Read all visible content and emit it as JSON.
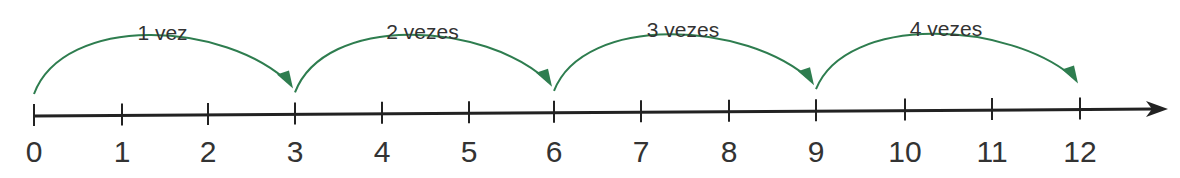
{
  "diagram": {
    "axis": {
      "ticks": [
        "0",
        "1",
        "2",
        "3",
        "4",
        "5",
        "6",
        "7",
        "8",
        "9",
        "10",
        "11",
        "12"
      ],
      "tick_x": [
        34,
        122,
        208,
        295,
        382,
        469,
        554,
        641,
        729,
        816,
        905,
        992,
        1080
      ],
      "y_start": 116,
      "y_end": 109,
      "x_start": 34,
      "x_end": 1168,
      "color": "#222222"
    },
    "jumps": [
      {
        "label": "1 vez",
        "from": 0,
        "to": 3
      },
      {
        "label": "2 vezes",
        "from": 3,
        "to": 6
      },
      {
        "label": "3 vezes",
        "from": 6,
        "to": 9
      },
      {
        "label": "4 vezes",
        "from": 9,
        "to": 12
      }
    ],
    "arc_color": "#2e7d4f"
  }
}
